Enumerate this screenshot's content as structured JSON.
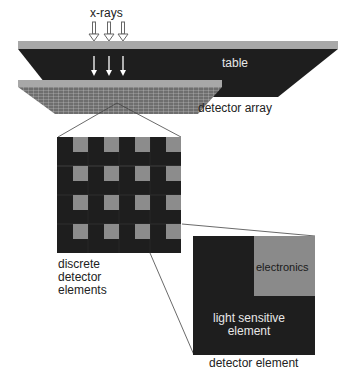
{
  "labels": {
    "xrays": "x-rays",
    "table": "table",
    "detector_array": "detector array",
    "discrete_line1": "discrete",
    "discrete_line2": "detector",
    "discrete_line3": "elements",
    "electronics": "electronics",
    "light_sensitive_line1": "light sensitive",
    "light_sensitive_line2": "element",
    "detector_element": "detector element"
  },
  "colors": {
    "dark": "#1e1e1e",
    "strip": "#a8a8a8",
    "grid_light": "#8c8c8c",
    "electronics": "#8a8a8a",
    "line": "#444444"
  },
  "grid": {
    "rows": 4,
    "cols": 4
  }
}
